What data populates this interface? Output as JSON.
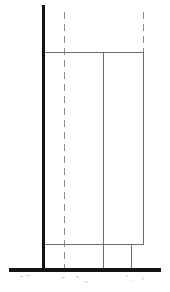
{
  "document": {
    "title": "Technical Elevation Drawing",
    "type": "line-drawing",
    "width": 170,
    "height": 292,
    "background_color": "#ffffff"
  },
  "styles": {
    "heavy_stroke_color": "#111111",
    "heavy_stroke_width": 3.2,
    "base_stroke_color": "#141414",
    "base_stroke_width": 4.0,
    "thin_stroke_color": "#6d6d6d",
    "thin_stroke_width": 1.0,
    "centerline_stroke_color": "#8e8e8e",
    "centerline_stroke_width": 1.1,
    "centerline_dash": "7 5",
    "faint_stroke_color": "#cfcfcf",
    "faint_stroke_width": 1.0,
    "faint_dash": "3 5"
  },
  "geometry": {
    "heavy_column": {
      "name": "vertical-column-left",
      "x1": 43.5,
      "y1": 5,
      "x2": 43.5,
      "y2": 270
    },
    "base_plate": {
      "name": "horizontal-base-plate",
      "x1": 9,
      "y1": 269.5,
      "x2": 161,
      "y2": 269.5
    },
    "thin_lines": [
      {
        "name": "top-chord-horizontal",
        "x1": 43.5,
        "y1": 52.5,
        "x2": 144,
        "y2": 52.5
      },
      {
        "name": "lower-chord-horizontal",
        "x1": 43.5,
        "y1": 244.5,
        "x2": 144,
        "y2": 244.5
      },
      {
        "name": "inner-vertical-divider",
        "x1": 103.5,
        "y1": 52.5,
        "x2": 103.5,
        "y2": 269.5
      },
      {
        "name": "outer-vertical-edge",
        "x1": 143.5,
        "y1": 52.5,
        "x2": 143.5,
        "y2": 244.5
      },
      {
        "name": "short-vertical-stub",
        "x1": 131.5,
        "y1": 244.5,
        "x2": 131.5,
        "y2": 269.5
      }
    ],
    "centerlines": [
      {
        "name": "centerline-left",
        "x": 64.5,
        "y1": 12,
        "y2": 272
      },
      {
        "name": "centerline-right",
        "x": 143.5,
        "y1": 12,
        "y2": 52.5
      }
    ],
    "faint_marks": [
      {
        "name": "faint-mark-below-base-left",
        "x1": 20,
        "y1": 277,
        "x2": 30,
        "y2": 275
      },
      {
        "name": "faint-mark-below-base-center-left",
        "x1": 62,
        "y1": 277,
        "x2": 68,
        "y2": 277
      },
      {
        "name": "faint-mark-below-base-center",
        "x1": 76,
        "y1": 276,
        "x2": 82,
        "y2": 280
      },
      {
        "name": "faint-mark-below-base-mid",
        "x1": 85,
        "y1": 281,
        "x2": 89,
        "y2": 283
      },
      {
        "name": "faint-mark-below-base-right",
        "x1": 126,
        "y1": 275,
        "x2": 132,
        "y2": 281
      },
      {
        "name": "faint-mark-below-base-far-right",
        "x1": 142,
        "y1": 277,
        "x2": 144,
        "y2": 281
      }
    ]
  }
}
